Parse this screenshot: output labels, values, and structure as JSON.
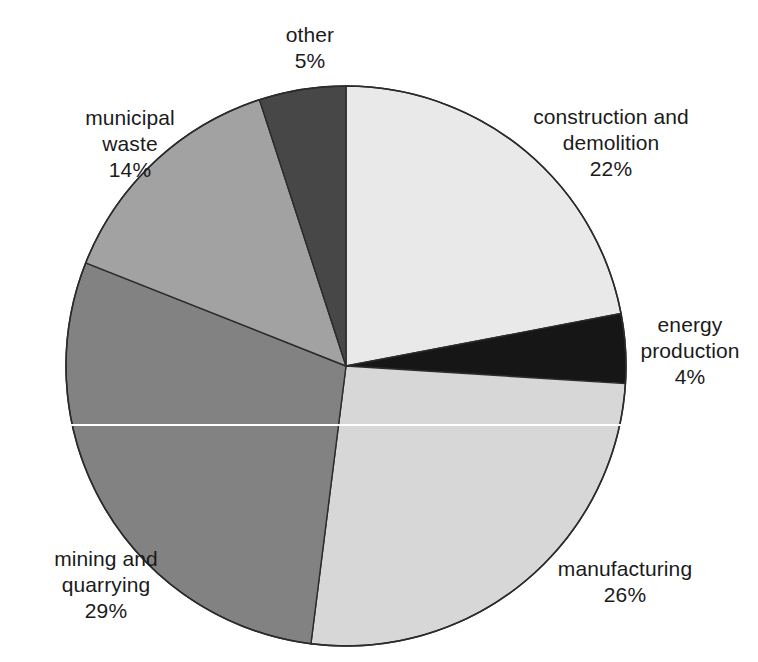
{
  "chart_data": {
    "type": "pie",
    "title": "",
    "subtitle": "",
    "xlabel": "",
    "ylabel": "",
    "legend_position": "none",
    "grid": false,
    "units": "percent",
    "start_angle_deg": 0,
    "direction": "clockwise",
    "center": {
      "x": 346,
      "y": 366
    },
    "radius": 280,
    "categories": [
      "construction and demolition",
      "energy production",
      "manufacturing",
      "mining and quarrying",
      "municipal waste",
      "other"
    ],
    "values": [
      22,
      4,
      26,
      29,
      14,
      5
    ],
    "slices": [
      {
        "label_line1": "construction and",
        "label_line2": "demolition",
        "value": 22,
        "value_label": "22%",
        "color": "#e9e9e9",
        "start_deg": 0,
        "end_deg": 79.2
      },
      {
        "label_line1": "energy",
        "label_line2": "production",
        "value": 4,
        "value_label": "4%",
        "color": "#161616",
        "start_deg": 79.2,
        "end_deg": 93.6
      },
      {
        "label_line1": "manufacturing",
        "label_line2": "",
        "value": 26,
        "value_label": "26%",
        "color": "#d7d7d7",
        "start_deg": 93.6,
        "end_deg": 187.2
      },
      {
        "label_line1": "mining and",
        "label_line2": "quarrying",
        "value": 29,
        "value_label": "29%",
        "color": "#828282",
        "start_deg": 187.2,
        "end_deg": 291.6
      },
      {
        "label_line1": "municipal",
        "label_line2": "waste",
        "value": 14,
        "value_label": "14%",
        "color": "#a2a2a2",
        "start_deg": 291.6,
        "end_deg": 342.0
      },
      {
        "label_line1": "other",
        "label_line2": "",
        "value": 5,
        "value_label": "5%",
        "color": "#474747",
        "start_deg": 342.0,
        "end_deg": 360.0
      }
    ]
  },
  "labels": {
    "other": {
      "name": "other",
      "pct": "5%"
    },
    "municipal_waste": {
      "name": "municipal",
      "name2": "waste",
      "pct": "14%"
    },
    "construction": {
      "name": "construction and",
      "name2": "demolition",
      "pct": "22%"
    },
    "energy": {
      "name": "energy",
      "name2": "production",
      "pct": "4%"
    },
    "manufacturing": {
      "name": "manufacturing",
      "pct": "26%"
    },
    "mining": {
      "name": "mining and",
      "name2": "quarrying",
      "pct": "29%"
    }
  },
  "colors": {
    "background": "#ffffff",
    "outline": "#2b2b2b",
    "text": "#1b1b1b",
    "construction": "#e9e9e9",
    "energy": "#161616",
    "manufacturing": "#d7d7d7",
    "mining": "#828282",
    "municipal_waste": "#a2a2a2",
    "other": "#474747"
  }
}
